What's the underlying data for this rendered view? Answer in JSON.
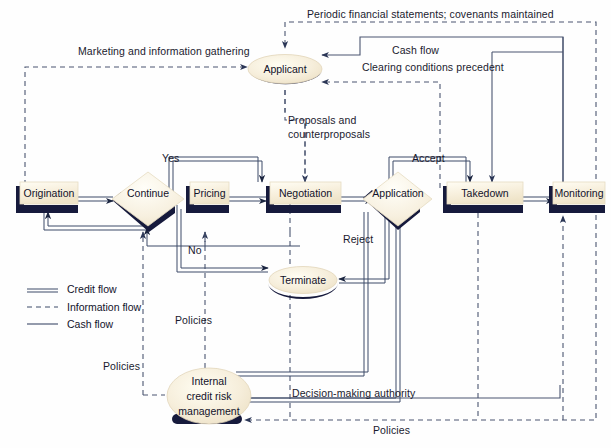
{
  "diagram": {
    "colors": {
      "node_fill": "#f4ecd8",
      "node_fill_light": "#faf5e6",
      "shadow": "#1b1f४0",
      "shadow_navy": "#161a3c",
      "line": "#3a4a66",
      "text": "#12122a"
    }
  },
  "nodes": {
    "applicant": {
      "label": "Applicant",
      "shape": "ellipse"
    },
    "origination": {
      "label": "Origination",
      "shape": "box"
    },
    "continue": {
      "label": "Continue",
      "shape": "diamond"
    },
    "pricing": {
      "label": "Pricing",
      "shape": "box"
    },
    "negotiation": {
      "label": "Negotiation",
      "shape": "box"
    },
    "application": {
      "label": "Application",
      "shape": "diamond"
    },
    "takedown": {
      "label": "Takedown",
      "shape": "box"
    },
    "monitoring": {
      "label": "Monitoring",
      "shape": "box"
    },
    "terminate": {
      "label": "Terminate",
      "shape": "ellipse"
    },
    "internal_credit_risk": {
      "label_line1": "Internal",
      "label_line2": "credit risk",
      "label_line3": "management",
      "shape": "ellipse"
    }
  },
  "edge_labels": {
    "periodic": "Periodic financial statements; covenants maintained",
    "marketing": "Marketing and information gathering",
    "cash_flow": "Cash flow",
    "clearing": "Clearing conditions precedent",
    "proposals_l1": "Proposals and",
    "proposals_l2": "counterproposals",
    "yes": "Yes",
    "no": "No",
    "accept": "Accept",
    "reject": "Reject",
    "policies_mid": "Policies",
    "policies_left": "Policies",
    "policies_bottom": "Policies",
    "decision_authority": "Decision-making authority"
  },
  "legend": {
    "items": [
      {
        "label": "Credit flow",
        "style": "double-line"
      },
      {
        "label": "Information flow",
        "style": "dashed-line"
      },
      {
        "label": "Cash flow",
        "style": "solid-line"
      }
    ]
  }
}
